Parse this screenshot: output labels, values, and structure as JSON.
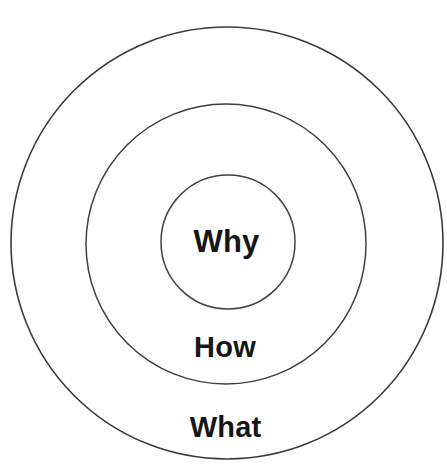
{
  "diagram": {
    "name": "golden-circle",
    "background_color": "#ffffff",
    "stroke_color": "#3a3a3a",
    "text_color": "#161616",
    "rings": [
      {
        "id": "outer",
        "label": "What",
        "center_x": 227,
        "center_y": 243,
        "radius": 216
      },
      {
        "id": "middle",
        "label": "How",
        "center_x": 226,
        "center_y": 244,
        "radius": 140
      },
      {
        "id": "inner",
        "label": "Why",
        "center_x": 228,
        "center_y": 242,
        "radius": 67
      }
    ]
  },
  "chart_data": {
    "type": "diagram",
    "subtype": "concentric-circles",
    "title": "",
    "categories": [
      "Why",
      "How",
      "What"
    ],
    "values": [
      67,
      140,
      216
    ],
    "series": [
      {
        "name": "ring radius (px)",
        "values": [
          67,
          140,
          216
        ]
      }
    ],
    "annotations": [
      "Why",
      "How",
      "What"
    ],
    "legend": "none",
    "grid": false
  }
}
